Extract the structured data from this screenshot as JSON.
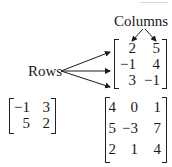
{
  "labels": {
    "columns": "Columns",
    "rows": "Rows"
  },
  "matrices": {
    "annotated": {
      "rows": [
        [
          "2",
          "5"
        ],
        [
          "−1",
          "4"
        ],
        [
          "3",
          "−1"
        ]
      ]
    },
    "two_by_two": {
      "rows": [
        [
          "−1",
          "3"
        ],
        [
          "5",
          "2"
        ]
      ]
    },
    "three_by_three": {
      "rows": [
        [
          "4",
          "0",
          "1"
        ],
        [
          "5",
          "−3",
          "7"
        ],
        [
          "2",
          "1",
          "4"
        ]
      ]
    }
  },
  "colors": {
    "ink": "#1a1a1a",
    "background": "#ffffff"
  }
}
